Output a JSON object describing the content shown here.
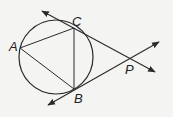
{
  "diagram": {
    "colors": {
      "stroke": "#2a2a2a",
      "background": "#f4f4f2",
      "label": "#222222"
    },
    "circle": {
      "cx": 56,
      "cy": 57,
      "r": 37
    },
    "points": {
      "A": {
        "label": "A",
        "x": 20,
        "y": 48,
        "label_x": 9,
        "label_y": 51
      },
      "B": {
        "label": "B",
        "x": 74,
        "y": 89,
        "label_x": 74,
        "label_y": 103
      },
      "C": {
        "label": "C",
        "x": 74,
        "y": 28,
        "label_x": 72,
        "label_y": 26
      },
      "P": {
        "label": "P",
        "x": 129,
        "y": 60,
        "label_x": 125,
        "label_y": 74
      }
    },
    "segments": [
      {
        "name": "AC",
        "from": "A",
        "to": "C"
      },
      {
        "name": "AB",
        "from": "A",
        "to": "B"
      },
      {
        "name": "CB",
        "from": "C",
        "to": "B"
      }
    ],
    "tangent_lines": [
      {
        "name": "tangent-at-C",
        "x1": 42,
        "y1": 11,
        "x2": 155,
        "y2": 72
      },
      {
        "name": "tangent-at-B",
        "x1": 48,
        "y1": 105,
        "x2": 159,
        "y2": 42
      }
    ]
  }
}
